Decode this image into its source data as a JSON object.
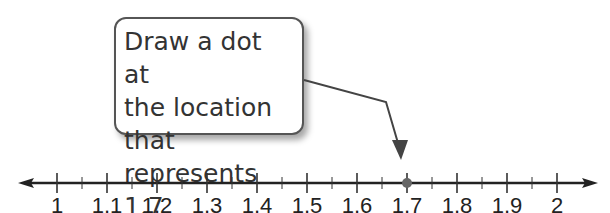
{
  "callout": {
    "text": "Draw a dot at\nthe location that\nrepresents 1.7."
  },
  "number_line": {
    "min": 1,
    "max": 2,
    "major_step": 0.1,
    "minor_step": 0.05,
    "labels": [
      "1",
      "1.1",
      "1.2",
      "1.3",
      "1.4",
      "1.5",
      "1.6",
      "1.7",
      "1.8",
      "1.9",
      "2"
    ],
    "highlighted_point": 1.7,
    "dot_color": "#666666",
    "line_color": "#222222"
  },
  "chart_data": {
    "type": "number_line",
    "title": "",
    "range": [
      1,
      2
    ],
    "tick_labels": [
      "1",
      "1.1",
      "1.2",
      "1.3",
      "1.4",
      "1.5",
      "1.6",
      "1.7",
      "1.8",
      "1.9",
      "2"
    ],
    "minor_ticks_between_labels": 1,
    "points": [
      1.7
    ],
    "annotation": "Draw a dot at the location that represents 1.7."
  }
}
